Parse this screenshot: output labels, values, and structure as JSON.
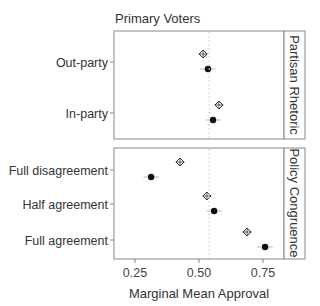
{
  "chart_data": {
    "type": "scatter",
    "title": "Primary Voters",
    "xlabel": "Marginal Mean Approval",
    "ylabel": "",
    "xlim": [
      0.19,
      0.83
    ],
    "xticks": [
      0.25,
      0.5,
      0.75
    ],
    "xtick_labels": [
      "0.25",
      "0.50",
      "0.75"
    ],
    "reference_line": 0.54,
    "grid": false,
    "legend": null,
    "marker_types": {
      "diamond": "open crossed diamond",
      "dot": "filled circle"
    },
    "panels": [
      {
        "strip": "Partisan Rhetoric",
        "categories": [
          "Out-party",
          "In-party"
        ],
        "series": [
          {
            "name": "diamond",
            "values": [
              0.516,
              0.578
            ],
            "ci_halfwidth": [
              0.02,
              0.02
            ]
          },
          {
            "name": "dot",
            "values": [
              0.535,
              0.555
            ],
            "ci_halfwidth": [
              0.03,
              0.03
            ]
          }
        ]
      },
      {
        "strip": "Policy Congruence",
        "categories": [
          "Full disagreement",
          "Half agreement",
          "Full agreement"
        ],
        "series": [
          {
            "name": "diamond",
            "values": [
              0.426,
              0.531,
              0.688
            ],
            "ci_halfwidth": [
              0.02,
              0.02,
              0.02
            ]
          },
          {
            "name": "dot",
            "values": [
              0.313,
              0.559,
              0.758
            ],
            "ci_halfwidth": [
              0.03,
              0.03,
              0.03
            ]
          }
        ]
      }
    ]
  }
}
